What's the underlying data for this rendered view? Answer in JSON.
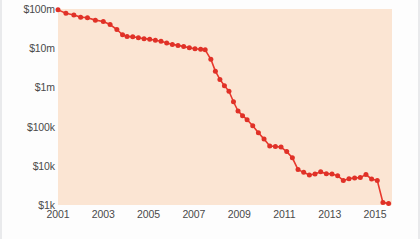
{
  "chart_data": {
    "type": "line",
    "title": "",
    "subtitle": "",
    "xlabel": "",
    "ylabel": "",
    "yscale": "log",
    "ylim": [
      1000,
      100000000
    ],
    "xlim": [
      2001,
      2015.75
    ],
    "grid": false,
    "legend": null,
    "line_color": "#e8382c",
    "marker_color": "#e03127",
    "plot_background": "#fbe5d3",
    "page_background": "#fdfdfd",
    "axis_text_color": "#4a4a4a",
    "ytick_labels": [
      "$100m",
      "$10m",
      "$1m",
      "$100k",
      "$10k",
      "$1k"
    ],
    "ytick_values": [
      100000000,
      10000000,
      1000000,
      100000,
      10000,
      1000
    ],
    "xtick_labels": [
      "2001",
      "2003",
      "2005",
      "2007",
      "2009",
      "2011",
      "2013",
      "2015"
    ],
    "xtick_values": [
      2001,
      2003,
      2005,
      2007,
      2009,
      2011,
      2013,
      2015
    ],
    "series": [
      {
        "name": "cost",
        "x": [
          2001.0,
          2001.35,
          2001.7,
          2002.0,
          2002.3,
          2002.65,
          2003.0,
          2003.3,
          2003.6,
          2003.85,
          2004.05,
          2004.3,
          2004.55,
          2004.8,
          2005.05,
          2005.3,
          2005.55,
          2005.8,
          2006.05,
          2006.3,
          2006.55,
          2006.8,
          2007.05,
          2007.3,
          2007.5,
          2007.75,
          2007.95,
          2008.15,
          2008.35,
          2008.55,
          2008.75,
          2008.95,
          2009.15,
          2009.35,
          2009.6,
          2009.85,
          2010.1,
          2010.35,
          2010.6,
          2010.85,
          2011.1,
          2011.35,
          2011.6,
          2011.85,
          2012.1,
          2012.35,
          2012.6,
          2012.85,
          2013.1,
          2013.35,
          2013.6,
          2013.85,
          2014.1,
          2014.35,
          2014.6,
          2014.85,
          2015.1,
          2015.35,
          2015.6
        ],
        "values": [
          95000000,
          78000000,
          70000000,
          62000000,
          60000000,
          52000000,
          48000000,
          40000000,
          30000000,
          22000000,
          20000000,
          19500000,
          18500000,
          17500000,
          17000000,
          16000000,
          15000000,
          13500000,
          12500000,
          11800000,
          11000000,
          10200000,
          9700000,
          9400000,
          9100000,
          5200000,
          2600000,
          1600000,
          1100000,
          800000,
          430000,
          250000,
          190000,
          150000,
          105000,
          70000,
          48000,
          32000,
          31000,
          30000,
          23000,
          16000,
          8000,
          6800,
          5800,
          6200,
          7000,
          6300,
          6200,
          5600,
          4200,
          4700,
          4900,
          5000,
          6000,
          4600,
          4200,
          1150,
          1100
        ]
      }
    ],
    "annotations": []
  }
}
